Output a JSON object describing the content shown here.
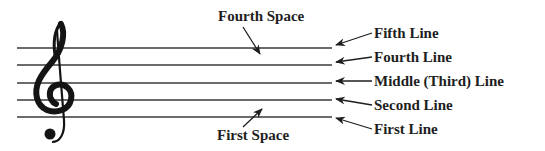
{
  "diagram": {
    "colors": {
      "ink": "#1e1e1e",
      "staff_line": "#3a3a3a",
      "background": "#ffffff"
    },
    "clef": {
      "icon": "treble-clef-icon",
      "glyph": "𝄞"
    },
    "space_labels": {
      "fourth_space": "Fourth Space",
      "first_space": "First Space"
    },
    "line_labels": [
      {
        "id": "fifth",
        "label": "Fifth Line"
      },
      {
        "id": "fourth",
        "label": "Fourth Line"
      },
      {
        "id": "middle",
        "label": "Middle (Third) Line"
      },
      {
        "id": "second",
        "label": "Second Line"
      },
      {
        "id": "first",
        "label": "First Line"
      }
    ]
  }
}
